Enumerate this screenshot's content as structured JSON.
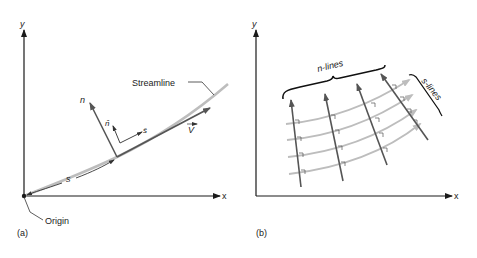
{
  "panel_a": {
    "caption": "(a)",
    "y_axis_label": "y",
    "x_axis_label": "x",
    "streamline_label": "Streamline",
    "origin_label": "Origin",
    "arc_length_label": "s",
    "normal_label": "n",
    "unit_normal_label": "n̂",
    "unit_tangent_label": "ŝ",
    "velocity_label": "V"
  },
  "panel_b": {
    "caption": "(b)",
    "y_axis_label": "y",
    "x_axis_label": "x",
    "n_lines_label": "n-lines",
    "s_lines_label": "s-lines"
  },
  "colors": {
    "axis": "#1a1a1a",
    "vector": "#555555",
    "streamline": "#bdbdbd",
    "text": "#222222"
  }
}
